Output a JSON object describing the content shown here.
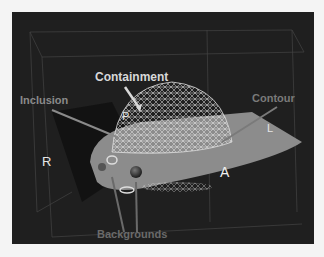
{
  "labels": {
    "containment": "Containment",
    "inclusion": "Inclusion",
    "contour": "Contour",
    "backgrounds": "Backgrounds",
    "p": "P",
    "l": "L",
    "r": "R",
    "a": "A"
  },
  "colors": {
    "panel_bg": "#1f1f1f",
    "page_bg": "#f4f4f4",
    "containment_label": "#d8d8d8",
    "inclusion_label": "#8a8a8a",
    "contour_label": "#7a7a7a",
    "backgrounds_label": "#6a6a6a",
    "surface": "#8c8c8c"
  }
}
